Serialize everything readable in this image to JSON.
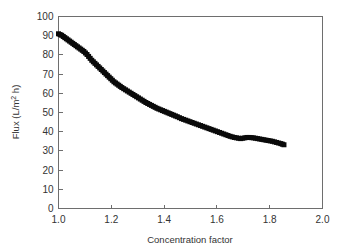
{
  "chart_data": {
    "type": "scatter",
    "title": "",
    "xlabel": "Concentration factor",
    "ylabel": "Flux (L/m2 h)",
    "ylabel_parts": {
      "pre": "Flux (L/m",
      "sup": "2",
      "post": " h)"
    },
    "xlim": [
      1.0,
      2.0
    ],
    "ylim": [
      0,
      100
    ],
    "xticks": [
      1.0,
      1.2,
      1.4,
      1.6,
      1.8,
      2.0
    ],
    "xtick_labels": [
      "1.0",
      "1.2",
      "1.4",
      "1.6",
      "1.8",
      "2.0"
    ],
    "yticks": [
      0,
      10,
      20,
      30,
      40,
      50,
      60,
      70,
      80,
      90,
      100
    ],
    "ytick_labels": [
      "0",
      "10",
      "20",
      "30",
      "40",
      "50",
      "60",
      "70",
      "80",
      "90",
      "100"
    ],
    "grid": false,
    "legend": null,
    "marker": "square",
    "marker_color": "#0a0a0a",
    "marker_size": 5,
    "series": [
      {
        "name": "Flux vs concentration factor",
        "x": [
          1.0,
          1.006,
          1.012,
          1.018,
          1.024,
          1.03,
          1.036,
          1.042,
          1.048,
          1.054,
          1.06,
          1.066,
          1.072,
          1.078,
          1.084,
          1.09,
          1.096,
          1.102,
          1.108,
          1.114,
          1.12,
          1.126,
          1.132,
          1.138,
          1.144,
          1.15,
          1.156,
          1.162,
          1.168,
          1.174,
          1.18,
          1.186,
          1.192,
          1.198,
          1.204,
          1.21,
          1.216,
          1.222,
          1.228,
          1.234,
          1.24,
          1.247,
          1.254,
          1.261,
          1.268,
          1.275,
          1.282,
          1.289,
          1.296,
          1.303,
          1.31,
          1.317,
          1.324,
          1.331,
          1.338,
          1.345,
          1.352,
          1.359,
          1.366,
          1.373,
          1.38,
          1.387,
          1.394,
          1.401,
          1.408,
          1.415,
          1.422,
          1.429,
          1.436,
          1.443,
          1.45,
          1.458,
          1.466,
          1.474,
          1.482,
          1.49,
          1.498,
          1.506,
          1.514,
          1.522,
          1.53,
          1.538,
          1.546,
          1.554,
          1.562,
          1.57,
          1.578,
          1.586,
          1.594,
          1.602,
          1.61,
          1.618,
          1.626,
          1.634,
          1.642,
          1.65,
          1.658,
          1.666,
          1.674,
          1.682,
          1.69,
          1.698,
          1.706,
          1.714,
          1.722,
          1.73,
          1.738,
          1.746,
          1.754,
          1.762,
          1.77,
          1.778,
          1.786,
          1.794,
          1.802,
          1.81,
          1.818,
          1.826,
          1.834,
          1.842,
          1.848,
          1.854
        ],
        "y": [
          91.0,
          90.6,
          90.2,
          89.6,
          89.0,
          88.4,
          87.8,
          87.2,
          86.6,
          86.0,
          85.4,
          84.8,
          84.2,
          83.6,
          83.0,
          82.4,
          81.8,
          81.0,
          80.2,
          79.2,
          78.2,
          77.2,
          76.4,
          75.6,
          74.8,
          74.0,
          73.2,
          72.4,
          71.6,
          70.8,
          70.0,
          69.2,
          68.4,
          67.6,
          66.8,
          66.0,
          65.4,
          64.8,
          64.2,
          63.6,
          63.0,
          62.4,
          61.8,
          61.2,
          60.6,
          60.0,
          59.4,
          58.8,
          58.2,
          57.6,
          57.0,
          56.4,
          55.8,
          55.2,
          54.7,
          54.2,
          53.7,
          53.2,
          52.7,
          52.2,
          51.8,
          51.4,
          51.0,
          50.6,
          50.2,
          49.8,
          49.4,
          49.0,
          48.6,
          48.2,
          47.8,
          47.3,
          46.8,
          46.4,
          46.0,
          45.6,
          45.2,
          44.8,
          44.4,
          44.0,
          43.6,
          43.2,
          42.8,
          42.4,
          42.0,
          41.6,
          41.2,
          40.8,
          40.4,
          40.0,
          39.6,
          39.2,
          38.8,
          38.4,
          38.0,
          37.6,
          37.3,
          37.0,
          36.8,
          36.6,
          36.4,
          36.6,
          36.8,
          37.0,
          37.0,
          36.9,
          36.8,
          36.6,
          36.4,
          36.2,
          36.0,
          35.8,
          35.6,
          35.4,
          35.2,
          35.0,
          34.7,
          34.4,
          34.1,
          33.8,
          33.5,
          33.2
        ]
      }
    ]
  }
}
